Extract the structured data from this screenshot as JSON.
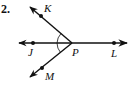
{
  "problem": {
    "number": "2."
  },
  "diagram": {
    "vertex": {
      "label": "P",
      "x": 72,
      "y": 43
    },
    "rays": [
      {
        "name": "ray-PK",
        "point_label": "K",
        "dot": [
          41,
          16
        ],
        "end": [
          28,
          5
        ]
      },
      {
        "name": "ray-PJ",
        "point_label": "J",
        "dot": [
          33,
          43
        ],
        "end": [
          17,
          43
        ]
      },
      {
        "name": "ray-PL",
        "point_label": "L",
        "dot": [
          114,
          43
        ],
        "end": [
          129,
          43
        ]
      },
      {
        "name": "ray-PM",
        "point_label": "M",
        "dot": [
          42,
          68
        ],
        "end": [
          28,
          79
        ]
      }
    ],
    "angle_marks": [
      "∠KPJ",
      "∠JPM"
    ],
    "labels": {
      "K": "K",
      "J": "J",
      "P": "P",
      "L": "L",
      "M": "M"
    },
    "stroke_color": "#111111"
  }
}
